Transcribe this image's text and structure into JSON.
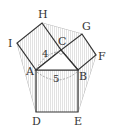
{
  "diagram": {
    "points": {
      "H": [
        42,
        23
      ],
      "G": [
        82,
        34
      ],
      "C": [
        61,
        50
      ],
      "F": [
        96,
        55
      ],
      "I": [
        17,
        43
      ],
      "A": [
        36,
        70
      ],
      "B": [
        78,
        70
      ],
      "D": [
        36,
        112
      ],
      "E": [
        78,
        112
      ]
    },
    "labels": {
      "H": "H",
      "G": "G",
      "C": "C",
      "F": "F",
      "I": "I",
      "A": "A",
      "B": "B",
      "D": "D",
      "E": "E"
    },
    "measures": {
      "AC": "4",
      "AB": "5"
    },
    "colors": {
      "stroke": "#333333",
      "fill": "#e6e6e6",
      "thin_line": "#777777",
      "dashed": "#888888"
    }
  }
}
